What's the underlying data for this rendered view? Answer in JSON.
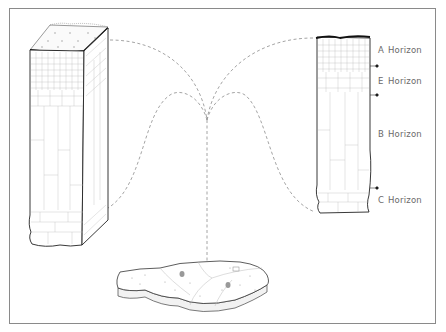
{
  "diagram": {
    "type": "soil-profile-illustration",
    "horizons": [
      {
        "letter": "A",
        "word": "Horizon"
      },
      {
        "letter": "E",
        "word": "Horizon"
      },
      {
        "letter": "B",
        "word": "Horizon"
      },
      {
        "letter": "C",
        "word": "Horizon"
      }
    ],
    "elements": {
      "left": "3D soil monolith block",
      "right": "2D soil profile column",
      "bottom": "landscape parcel (pedon location)"
    },
    "colors": {
      "outline": "#1a1a1a",
      "cell_lines": "#b8b8b8",
      "dashed_connector": "#9a9a9a",
      "label_text": "#6a6a6a",
      "frame": "#8a8a8a"
    }
  }
}
